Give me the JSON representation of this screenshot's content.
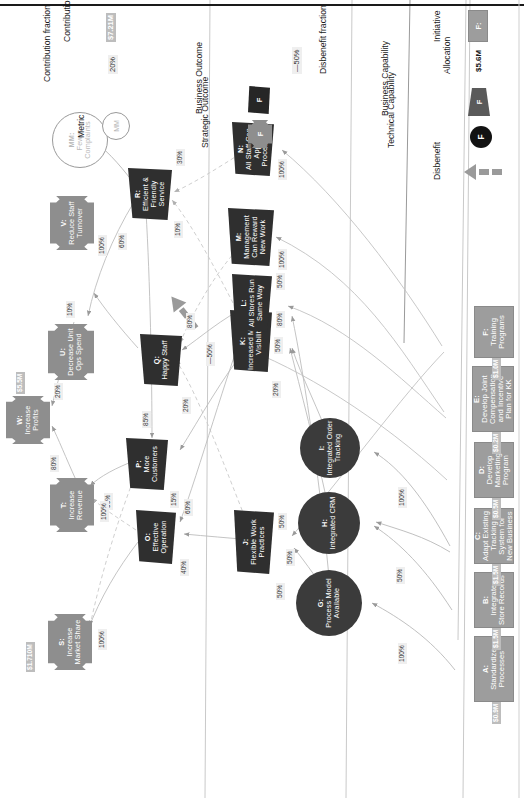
{
  "diagram": {
    "colors": {
      "initiative": "#9d9d9d",
      "capability": "#3b3b3b",
      "outcome": "#2f2f2f",
      "strategic_outcome": "#8e8e8e",
      "metric_outline": "#9a9a9a",
      "money_chip": "#bdbdbd",
      "pct_chip": "#efefef"
    },
    "columns": [
      "Initiatives",
      "Capabilities",
      "Business Outcomes",
      "Strategic Outcomes"
    ]
  },
  "initiatives": [
    {
      "id": "A",
      "label": "A:\nStandardize Processes",
      "title": "A:",
      "name": "Standardize Processes",
      "allocation": "$0.9M"
    },
    {
      "id": "B",
      "label": "B:\nIntegrate Store Records",
      "title": "B:",
      "name": "Integrate Store Records",
      "allocation": "$1.5M"
    },
    {
      "id": "C",
      "label": "C:\nAdapt Existing Tracking System for New Business",
      "title": "C:",
      "name": "Adapt Existing Tracking System for New Business",
      "allocation": "$1.5M"
    },
    {
      "id": "D",
      "label": "D:\nDevelop Marketing Program",
      "title": "D:",
      "name": "Develop Marketing Program",
      "allocation": "$0.5M"
    },
    {
      "id": "E",
      "label": "E:\nDevelop Joint Compensation and Incentive Plan for KK",
      "title": "E:",
      "name": "Develop Joint Compensation and Incentive Plan for KK",
      "allocation": "$0.2M"
    },
    {
      "id": "F",
      "label": "F:\nTraining Programs",
      "title": "F:",
      "name": "Training Programs",
      "allocation": "$1.0M"
    }
  ],
  "capabilities": [
    {
      "id": "G",
      "title": "G:",
      "name": "Process Model Available",
      "type": "technical"
    },
    {
      "id": "H",
      "title": "H:",
      "name": "Integrated CRM",
      "type": "technical"
    },
    {
      "id": "I",
      "title": "I:",
      "name": "Integrated Order Tracking",
      "type": "technical"
    }
  ],
  "business_outcomes_lower": [
    {
      "id": "J",
      "title": "J:",
      "name": "Flexible Work Practices"
    },
    {
      "id": "K",
      "title": "K:",
      "name": "Increased Market Visibility"
    },
    {
      "id": "L",
      "title": "L:",
      "name": "All Stores Run Same Way"
    },
    {
      "id": "M",
      "title": "M:",
      "name": "Management Can Reward New Work"
    },
    {
      "id": "N",
      "title": "N:",
      "name": "All Staff Can Apply Processes"
    }
  ],
  "business_outcomes_upper": [
    {
      "id": "O",
      "title": "O:",
      "name": "Effective Operation"
    },
    {
      "id": "P",
      "title": "P:",
      "name": "More Customers"
    },
    {
      "id": "Q",
      "title": "Q:",
      "name": "Happy Staff"
    },
    {
      "id": "R",
      "title": "R:",
      "name": "Efficient & Friendly Service"
    }
  ],
  "strategic_outcomes": [
    {
      "id": "S",
      "title": "S:",
      "name": "Increase Market Share",
      "contribution": "$1.710M"
    },
    {
      "id": "T",
      "title": "T:",
      "name": "Increase Revenue",
      "contribution": ""
    },
    {
      "id": "U",
      "title": "U:",
      "name": "Decrease Unit Ops Spend",
      "contribution": ""
    },
    {
      "id": "V",
      "title": "V:",
      "name": "Reduce Staff Turnover",
      "contribution": ""
    },
    {
      "id": "W",
      "title": "W:",
      "name": "Increase Profits",
      "contribution": "$5.5M"
    }
  ],
  "metrics": [
    {
      "id": "MM",
      "title": "MM:",
      "name": "Fewer Complaints"
    }
  ],
  "fractions": {
    "a_to_g": "100%",
    "b_to_h": "50%",
    "c_to_h": "50%",
    "c_to_i": "100%",
    "g_out": "100%",
    "h_out": "50%",
    "h_out2": "50%",
    "i_out": "100%",
    "j_left": "50%",
    "j_right": "50%",
    "k_left": "20%",
    "k_right": "80%",
    "l_left": "50%",
    "l_right": "50%",
    "m_in": "100%",
    "n_in": "100%",
    "o_left": "40%",
    "o_right": "60%",
    "p_left": "15%",
    "p_right": "85%",
    "p_up": "90%",
    "q_left": "20%",
    "q_right": "80%",
    "q_disben": "—50%",
    "r_up": "60%",
    "r_left": "10%",
    "r_right": "30%",
    "s_in": "100%",
    "t_in": "100%",
    "u_in": "10%",
    "v_in": "100%",
    "w_from_t": "80%",
    "w_from_u": "20%"
  },
  "legend": {
    "allocation_value": "$5.6M",
    "allocation_label": "Allocation",
    "initiative_swatch": "F:",
    "initiative_label": "Initiative",
    "disbenefit_label": "Disbenefit",
    "technical_capability_label": "Technical Capability",
    "technical_capability_swatch": "F",
    "business_capability_label": "Business Capability",
    "business_capability_swatch": "F",
    "disbenefit_fraction_value": "—50%",
    "disbenefit_fraction_label": "Disbenefit fraction",
    "strategic_outcome_label": "Strategic Outcome",
    "strategic_outcome_swatch": "F",
    "business_outcome_label": "Business Outcome",
    "business_outcome_swatch": "F",
    "metric_swatch": "MM",
    "metric_label": "Metric",
    "contribution_fraction_value": "20%",
    "contribution_fraction_label": "Contribution fraction",
    "contribution_value": "$7.21M",
    "contribution_label": "Contribution"
  }
}
